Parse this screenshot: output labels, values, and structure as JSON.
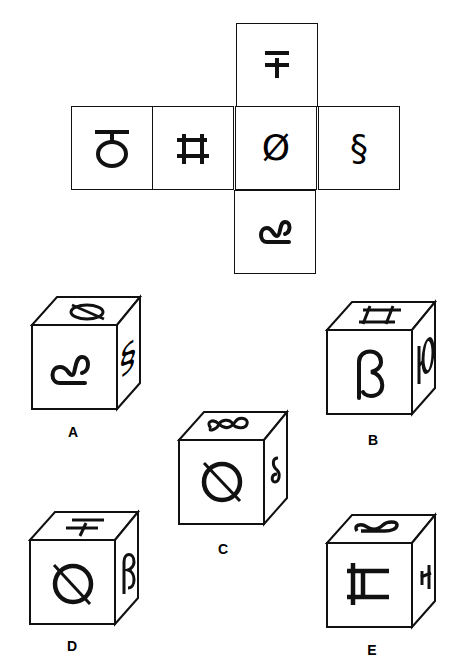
{
  "net": {
    "cells": [
      {
        "id": "top",
        "symbol": "∓"
      },
      {
        "id": "far-left",
        "symbol": "ठ"
      },
      {
        "id": "left",
        "symbol": "ਸ"
      },
      {
        "id": "center",
        "symbol": "Ø"
      },
      {
        "id": "right",
        "symbol": "§"
      },
      {
        "id": "bottom",
        "symbol": "ȣ"
      }
    ],
    "display": {
      "top": "∓",
      "far_left": "Ⴛ",
      "left": "ℍ",
      "center": "Ø",
      "right": "§",
      "bottom": "ꭕ"
    }
  },
  "options": [
    {
      "label": "A",
      "front": "ʗ",
      "top": "Ø",
      "side": "§"
    },
    {
      "label": "B",
      "front": "ß",
      "top": "H",
      "side": "Ю"
    },
    {
      "label": "C",
      "front": "Ø",
      "top": "§",
      "side": "§"
    },
    {
      "label": "D",
      "front": "Ø",
      "top": "∓",
      "side": "ß"
    },
    {
      "label": "E",
      "front": "H",
      "top": "ʗ",
      "side": "∓"
    }
  ]
}
